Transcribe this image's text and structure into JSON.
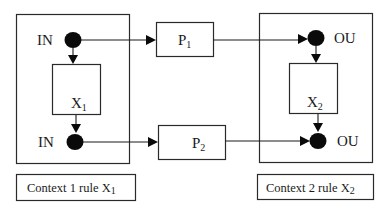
{
  "diagram": {
    "context1": {
      "input_top_label": "IN",
      "input_bottom_label": "IN",
      "rule_box": {
        "main": "X",
        "sub": "1"
      },
      "caption": {
        "main": "Context 1 rule X",
        "sub": "1"
      }
    },
    "context2": {
      "output_top_label": "OU",
      "output_bottom_label": "OU",
      "rule_box": {
        "main": "X",
        "sub": "2"
      },
      "caption": {
        "main": "Context 2 rule X",
        "sub": "2"
      }
    },
    "processes": [
      {
        "main": "P",
        "sub": "1"
      },
      {
        "main": "P",
        "sub": "2"
      }
    ],
    "edges": [
      {
        "from": "context1-input-top",
        "to": "process-1"
      },
      {
        "from": "process-1",
        "to": "context2-output-top"
      },
      {
        "from": "context1-input-top",
        "to": "rule-x1"
      },
      {
        "from": "rule-x1",
        "to": "context1-input-bottom"
      },
      {
        "from": "context1-input-bottom",
        "to": "process-2"
      },
      {
        "from": "process-2",
        "to": "context2-output-bottom"
      },
      {
        "from": "context2-output-top",
        "to": "rule-x2"
      },
      {
        "from": "rule-x2",
        "to": "context2-output-bottom"
      }
    ]
  }
}
